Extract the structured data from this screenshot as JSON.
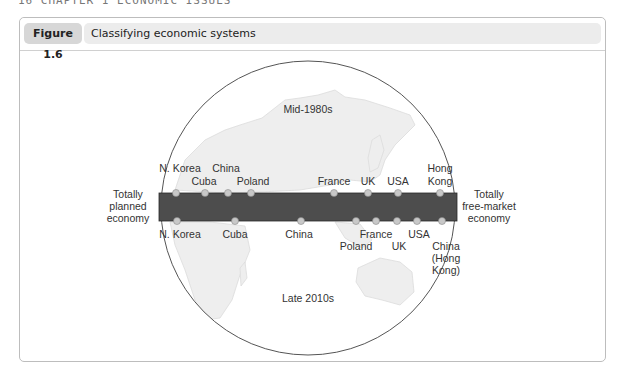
{
  "page_header": "16 CHAPTER 1 ECONOMIC ISSUES",
  "figure": {
    "number": "Figure 1.6",
    "title": "Classifying economic systems"
  },
  "diagram": {
    "period_top": "Mid-1980s",
    "period_bottom": "Late 2010s",
    "left_label": [
      "Totally",
      "planned",
      "economy"
    ],
    "right_label": [
      "Totally",
      "free-market",
      "economy"
    ],
    "colors": {
      "bar": "#4d4d4d",
      "dot": "#c8c8c8",
      "circle": "#555555",
      "land": "#eeeeee"
    },
    "top_row": [
      {
        "label": "N. Korea",
        "x": 176
      },
      {
        "label": "Cuba",
        "x": 205
      },
      {
        "label": "China",
        "x": 228
      },
      {
        "label": "Poland",
        "x": 251
      },
      {
        "label": "France",
        "x": 334
      },
      {
        "label": "UK",
        "x": 368
      },
      {
        "label": "USA",
        "x": 398
      },
      {
        "label": "Hong Kong",
        "x": 440
      }
    ],
    "bottom_row": [
      {
        "label": "N. Korea",
        "x": 177
      },
      {
        "label": "Cuba",
        "x": 235
      },
      {
        "label": "China",
        "x": 301
      },
      {
        "label": "Poland",
        "x": 356
      },
      {
        "label": "France",
        "x": 376
      },
      {
        "label": "UK",
        "x": 397
      },
      {
        "label": "USA",
        "x": 417
      },
      {
        "label": "China (Hong Kong)",
        "x": 442
      }
    ]
  }
}
